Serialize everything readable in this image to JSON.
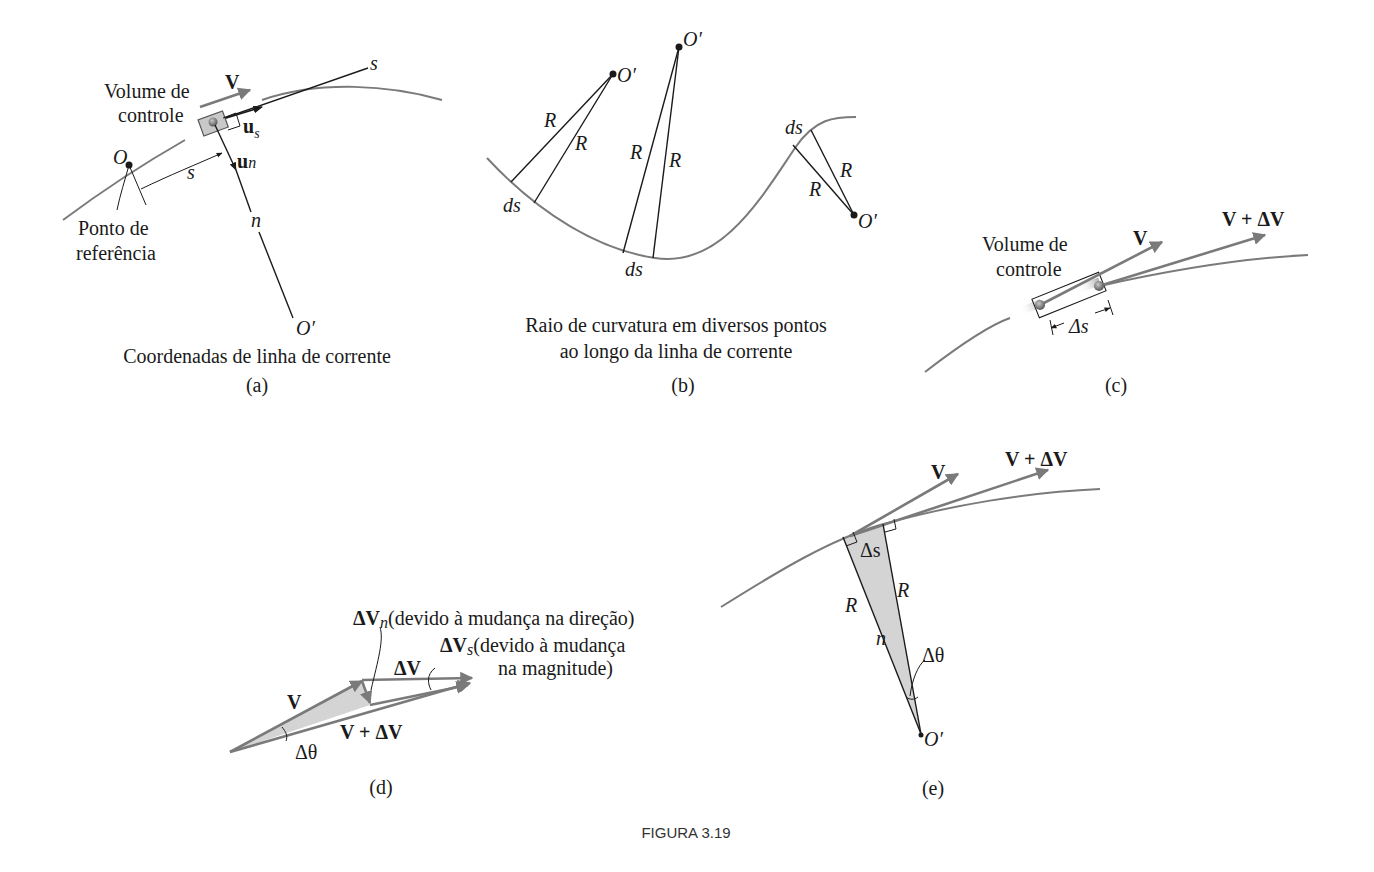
{
  "figure": {
    "caption": "FIGURA 3.19",
    "panels": {
      "a": {
        "letter": "(a)",
        "caption": "Coordenadas de linha de corrente",
        "volume_label_1": "Volume de",
        "volume_label_2": "controle",
        "velocity": "V",
        "axis_s": "s",
        "arc_s": "s",
        "unit_s": "u",
        "unit_s_sub": "s",
        "unit_n": "u",
        "unit_n_sub": "n",
        "origin": "O",
        "normal": "n",
        "center": "O′",
        "reference_1": "Ponto de",
        "reference_2": "referência"
      },
      "b": {
        "letter": "(b)",
        "caption_1": "Raio de curvatura em diversos pontos",
        "caption_2": "ao longo da linha de corrente",
        "center": "O′",
        "radius": "R",
        "element": "ds"
      },
      "c": {
        "letter": "(c)",
        "volume_label_1": "Volume de",
        "volume_label_2": "controle",
        "velocity": "V",
        "velocity_new": "V + ΔV",
        "delta_s": "Δs"
      },
      "d": {
        "letter": "(d)",
        "dvn": "ΔV",
        "dvn_sub": "n",
        "dvn_note": "(devido à mudança na direção)",
        "dvs": "ΔV",
        "dvs_sub": "s",
        "dvs_note_1": "(devido à mudança",
        "dvs_note_2": "na magnitude)",
        "dv": "ΔV",
        "velocity": "V",
        "velocity_new": "V + ΔV",
        "angle": "Δθ"
      },
      "e": {
        "letter": "(e)",
        "velocity": "V",
        "velocity_new": "V + ΔV",
        "delta_s": "Δs",
        "radius": "R",
        "normal": "n",
        "angle": "Δθ",
        "center": "O′"
      }
    },
    "colors": {
      "streamline": "#7a7a7a",
      "ink": "#1a1a1a",
      "shade": "#d4d4d4"
    }
  }
}
